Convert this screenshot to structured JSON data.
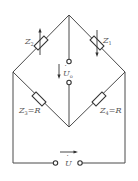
{
  "diagram": {
    "type": "bridge-circuit",
    "components": [
      {
        "id": "Z2",
        "label": "Z",
        "sub": "2",
        "eq": "",
        "position": "top-left",
        "variable": true,
        "arrow": "up"
      },
      {
        "id": "Z1",
        "label": "Z",
        "sub": "1",
        "eq": "",
        "position": "top-right",
        "variable": true,
        "arrow": "down"
      },
      {
        "id": "Z3",
        "label": "Z",
        "sub": "3",
        "eq": "=R",
        "position": "bottom-left",
        "variable": false
      },
      {
        "id": "Z4",
        "label": "Z",
        "sub": "4",
        "eq": "=R",
        "position": "bottom-right",
        "variable": false
      }
    ],
    "output": {
      "label": "U",
      "sub": "o",
      "dot": "·",
      "direction": "down"
    },
    "source": {
      "label": "U",
      "dot": "·",
      "direction": "right"
    },
    "colors": {
      "wire": "#4a4a4a",
      "text": "#555555"
    }
  }
}
